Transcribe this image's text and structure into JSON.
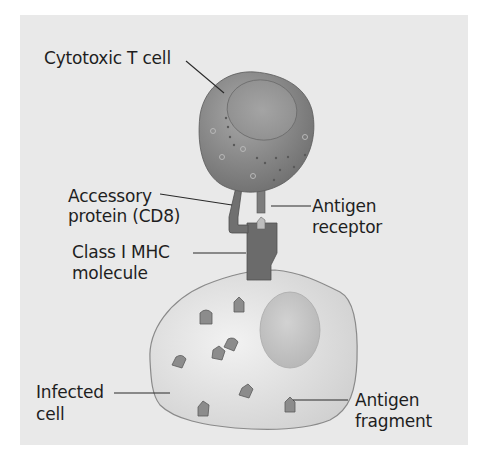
{
  "diagram": {
    "type": "biology-illustration",
    "colors": {
      "panel_background": "#e9e9e9",
      "t_cell": "#8a8a8a",
      "t_cell_nucleus": "#9a9a9a",
      "mhc_molecule": "#6e6e6e",
      "cd8_protein": "#707070",
      "antigen_fragment": "#8c8c8c",
      "infected_cell": "#dcdcdc",
      "infected_cell_nucleus": "#c4c4c4",
      "text": "#1e1e1e"
    },
    "labels": {
      "t_cell": "Cytotoxic T cell",
      "accessory_line1": "Accessory",
      "accessory_line2": "protein (CD8)",
      "mhc_line1": "Class I MHC",
      "mhc_line2": "molecule",
      "receptor_line1": "Antigen",
      "receptor_line2": "receptor",
      "infected_line1": "Infected",
      "infected_line2": "cell",
      "fragment_line1": "Antigen",
      "fragment_line2": "fragment"
    }
  }
}
